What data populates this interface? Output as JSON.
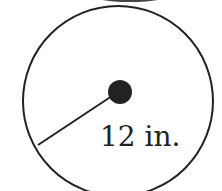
{
  "diagram": {
    "shape": "circle",
    "radius_label": "12 in.",
    "stroke_color": "#222222",
    "fill_color": "#ffffff"
  }
}
